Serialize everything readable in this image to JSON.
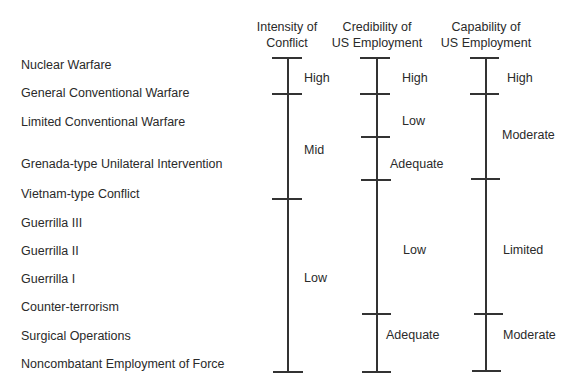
{
  "headers": [
    {
      "line1": "Intensity of",
      "line2": "Conflict"
    },
    {
      "line1": "Credibility of",
      "line2": "US Employment"
    },
    {
      "line1": "Capability of",
      "line2": "US Employment"
    }
  ],
  "rows": [
    "Nuclear Warfare",
    "General Conventional Warfare",
    "Limited Conventional Warfare",
    "Grenada-type Unilateral Intervention",
    "Vietnam-type Conflict",
    "Guerrilla III",
    "Guerrilla II",
    "Guerrilla I",
    "Counter-terrorism",
    "Surgical Operations",
    "Noncombatant Employment of Force"
  ],
  "scales": {
    "intensity": {
      "segments": [
        "High",
        "Mid",
        "Low"
      ]
    },
    "credibility": {
      "segments": [
        "High",
        "Low",
        "Adequate",
        "Low",
        "Adequate"
      ]
    },
    "capability": {
      "segments": [
        "High",
        "Moderate",
        "Limited",
        "Moderate"
      ]
    }
  },
  "colors": {
    "line": "#333333",
    "text": "#2a2a2a",
    "background": "#ffffff"
  }
}
